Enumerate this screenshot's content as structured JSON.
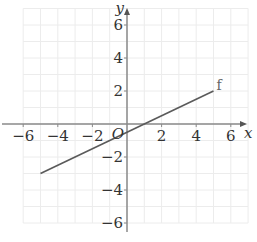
{
  "chart_data": {
    "type": "line",
    "title": "",
    "xlabel": "x",
    "ylabel": "y",
    "origin_label": "O",
    "xlim": [
      -6,
      7
    ],
    "ylim": [
      -6,
      7
    ],
    "grid": true,
    "grid_step": 1,
    "x_ticks": [
      -6,
      -4,
      -2,
      2,
      4,
      6
    ],
    "y_ticks": [
      -6,
      -4,
      -2,
      2,
      4,
      6
    ],
    "x_tick_labels": [
      "−6",
      "−4",
      "−2",
      "2",
      "4",
      "6"
    ],
    "y_tick_labels": [
      "−6",
      "−4",
      "−2",
      "2",
      "4",
      "6"
    ],
    "series": [
      {
        "name": "f",
        "equation": "y = 0.5x - 0.5",
        "x": [
          -5,
          5
        ],
        "y": [
          -3,
          2
        ],
        "color": "#5a5a5a"
      }
    ],
    "legend": "inline label 'f' at line end"
  }
}
